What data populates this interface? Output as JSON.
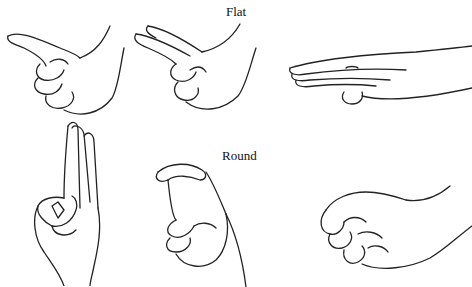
{
  "figure": {
    "rows": [
      {
        "label": "Flat",
        "hands": [
          "pointing-flat-hand",
          "two-finger-flat-hand",
          "flat-palm-hand"
        ]
      },
      {
        "label": "Round",
        "hands": [
          "o-ring-hand",
          "c-curve-hand",
          "curled-fist-hand"
        ]
      }
    ]
  }
}
